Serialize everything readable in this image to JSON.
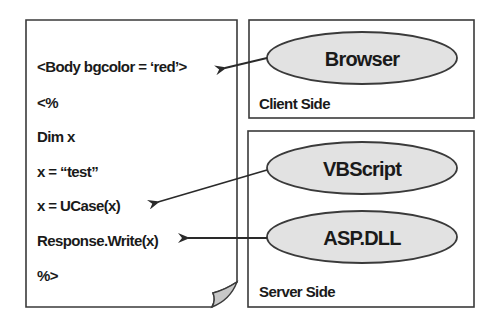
{
  "document": {
    "lines": [
      "<Body bgcolor =  ‘red’>",
      "<%",
      "Dim x",
      "x = “test”",
      "x = UCase(x)",
      "Response.Write(x)",
      "%>"
    ]
  },
  "client": {
    "label": "Client Side",
    "components": [
      {
        "name": "Browser",
        "points_to_line": 0
      }
    ]
  },
  "server": {
    "label": "Server Side",
    "components": [
      {
        "name": "VBScript",
        "points_to_line": 4
      },
      {
        "name": "ASP.DLL",
        "points_to_line": 5
      }
    ]
  },
  "colors": {
    "stroke": "#3a3a3a",
    "ellipse_fill": "#e2e2e2",
    "fold_fill": "#c8c8c8",
    "background": "#ffffff"
  }
}
